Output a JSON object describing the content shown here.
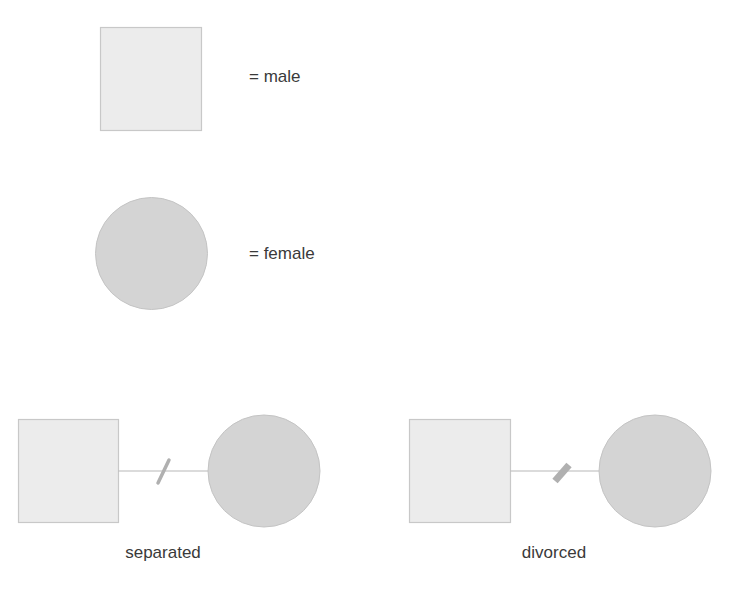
{
  "legend": {
    "male": {
      "symbol": "square",
      "label": "= male"
    },
    "female": {
      "symbol": "circle",
      "label": "= female"
    }
  },
  "relationships": [
    {
      "type": "separated",
      "caption": "separated",
      "marker": "single-slash"
    },
    {
      "type": "divorced",
      "caption": "divorced",
      "marker": "double-slash"
    }
  ],
  "colors": {
    "male_fill": "#ececec",
    "male_stroke": "#c8c8c8",
    "female_fill": "#d4d4d4",
    "female_stroke": "#c4c4c4",
    "line": "#b8b8b8",
    "marker": "#b0b0b0",
    "text": "#3a3a3a"
  }
}
